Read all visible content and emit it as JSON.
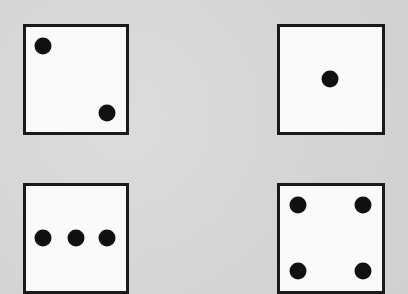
{
  "dice": [
    {
      "id": "die-two",
      "value": 2,
      "box": {
        "x": 23,
        "y": 24,
        "w": 106,
        "h": 111
      },
      "pips": [
        [
          43,
          46
        ],
        [
          107,
          113
        ]
      ]
    },
    {
      "id": "die-one",
      "value": 1,
      "box": {
        "x": 277,
        "y": 24,
        "w": 108,
        "h": 111
      },
      "pips": [
        [
          330,
          79
        ]
      ]
    },
    {
      "id": "die-three",
      "value": 3,
      "box": {
        "x": 23,
        "y": 183,
        "w": 106,
        "h": 111
      },
      "pips": [
        [
          43,
          238
        ],
        [
          76,
          238
        ],
        [
          107,
          238
        ]
      ]
    },
    {
      "id": "die-four",
      "value": 4,
      "box": {
        "x": 277,
        "y": 183,
        "w": 108,
        "h": 111
      },
      "pips": [
        [
          298,
          205
        ],
        [
          363,
          205
        ],
        [
          298,
          271
        ],
        [
          363,
          271
        ]
      ]
    }
  ],
  "colors": {
    "background": "#d6d6d6",
    "face": "#fafafa",
    "border": "#1a1a1a",
    "pip": "#111111"
  }
}
